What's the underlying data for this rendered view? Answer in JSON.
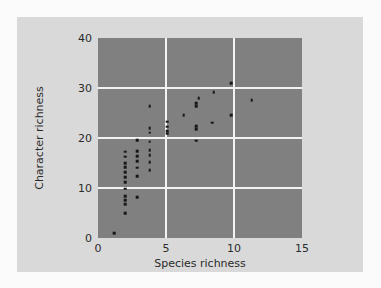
{
  "figure": {
    "background_color": "#d9d9d9",
    "page_color": "#fbfbfb"
  },
  "chart_data": {
    "type": "scatter",
    "title": "",
    "xlabel": "Species richness",
    "ylabel": "Character richness",
    "xlim": [
      0,
      15
    ],
    "ylim": [
      0,
      40
    ],
    "xticks": [
      0,
      5,
      10,
      15
    ],
    "yticks": [
      0,
      10,
      20,
      30,
      40
    ],
    "grid": true,
    "gridlines_x": [
      5,
      10
    ],
    "gridlines_y": [
      10,
      20,
      30
    ],
    "grid_color": "#f2f2f2",
    "plot_background": "#808080",
    "marker_color": "#17171a",
    "legend": null,
    "series": [
      {
        "name": "taxa",
        "points": [
          [
            1.2,
            1.0
          ],
          [
            2.0,
            5.0
          ],
          [
            2.0,
            6.8
          ],
          [
            2.0,
            7.6
          ],
          [
            2.0,
            8.4
          ],
          [
            2.0,
            9.9
          ],
          [
            2.0,
            11.2
          ],
          [
            2.0,
            12.2
          ],
          [
            2.0,
            13.2
          ],
          [
            2.0,
            14.2
          ],
          [
            2.0,
            15.0
          ],
          [
            2.0,
            16.3
          ],
          [
            2.0,
            17.3
          ],
          [
            2.9,
            8.2
          ],
          [
            2.9,
            12.4
          ],
          [
            2.9,
            14.1
          ],
          [
            2.9,
            15.4
          ],
          [
            2.9,
            16.4
          ],
          [
            2.9,
            17.4
          ],
          [
            2.9,
            19.6
          ],
          [
            3.8,
            13.6
          ],
          [
            3.8,
            15.2
          ],
          [
            3.8,
            16.6
          ],
          [
            3.8,
            17.6
          ],
          [
            3.8,
            19.3
          ],
          [
            3.8,
            21.1
          ],
          [
            3.8,
            22.0
          ],
          [
            3.8,
            26.4
          ],
          [
            5.1,
            20.9
          ],
          [
            5.1,
            21.4
          ],
          [
            5.1,
            22.3
          ],
          [
            5.1,
            23.3
          ],
          [
            6.3,
            24.6
          ],
          [
            7.2,
            19.5
          ],
          [
            7.2,
            21.8
          ],
          [
            7.2,
            22.4
          ],
          [
            7.2,
            26.4
          ],
          [
            7.2,
            27.0
          ],
          [
            7.4,
            28.0
          ],
          [
            8.4,
            23.1
          ],
          [
            8.5,
            29.2
          ],
          [
            9.8,
            24.6
          ],
          [
            9.8,
            31.0
          ],
          [
            11.3,
            27.6
          ]
        ]
      }
    ]
  }
}
